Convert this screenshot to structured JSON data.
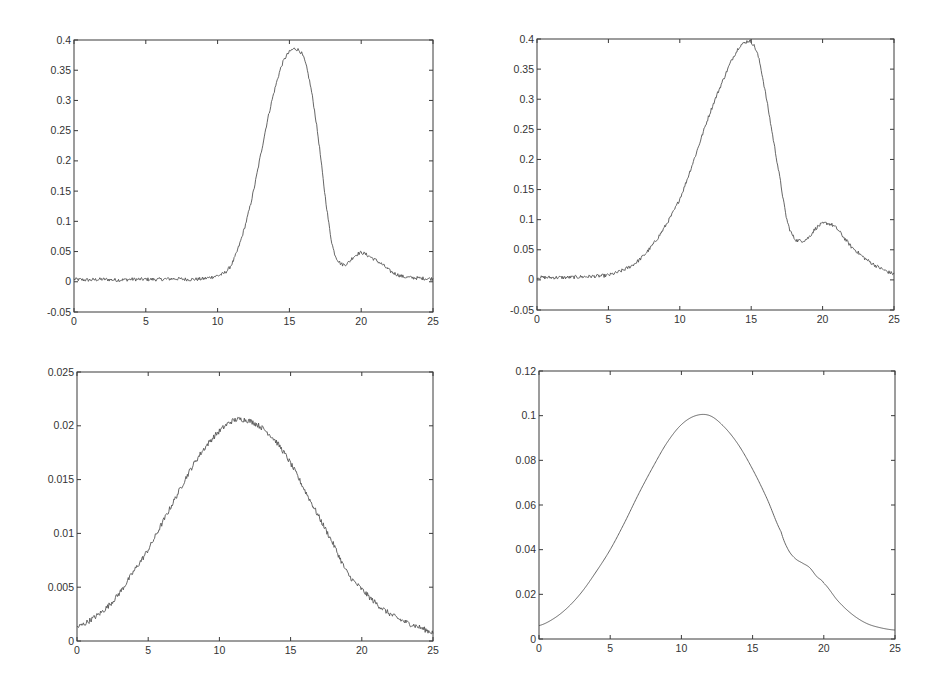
{
  "figure": {
    "background": "#ffffff",
    "line_color": "#555555",
    "axis_color": "#3a3a3a"
  },
  "chart_data": [
    {
      "id": "top-left",
      "type": "line",
      "title": "",
      "xlabel": "",
      "ylabel": "",
      "xlim": [
        0,
        25
      ],
      "ylim": [
        -0.05,
        0.4
      ],
      "xticks": [
        0,
        5,
        10,
        15,
        20,
        25
      ],
      "xtick_labels": [
        "0",
        "5",
        "10",
        "15",
        "20",
        "25"
      ],
      "yticks": [
        -0.05,
        0,
        0.05,
        0.1,
        0.15,
        0.2,
        0.25,
        0.3,
        0.35,
        0.4
      ],
      "ytick_labels": [
        "-0.05",
        "0",
        "0.05",
        "0.1",
        "0.15",
        "0.2",
        "0.25",
        "0.3",
        "0.35",
        "0.4"
      ],
      "grid": false,
      "legend": null,
      "noise": 0.003,
      "box": {
        "left": 74,
        "top": 40,
        "right": 433,
        "bottom": 312
      },
      "x": [
        0,
        1,
        2,
        3,
        4,
        5,
        6,
        7,
        8,
        9,
        10,
        10.5,
        11,
        11.5,
        12,
        12.5,
        13,
        13.5,
        14,
        14.5,
        15,
        15.5,
        16,
        16.5,
        17,
        17.5,
        18,
        18.5,
        19,
        19.5,
        20,
        20.5,
        21,
        21.5,
        22,
        22.5,
        23,
        24,
        25
      ],
      "y": [
        0.004,
        0.003,
        0.004,
        0.003,
        0.004,
        0.004,
        0.004,
        0.005,
        0.004,
        0.005,
        0.01,
        0.015,
        0.03,
        0.06,
        0.1,
        0.15,
        0.21,
        0.27,
        0.32,
        0.36,
        0.38,
        0.385,
        0.37,
        0.32,
        0.24,
        0.14,
        0.06,
        0.032,
        0.03,
        0.042,
        0.048,
        0.043,
        0.036,
        0.028,
        0.018,
        0.012,
        0.008,
        0.006,
        0.005
      ]
    },
    {
      "id": "top-right",
      "type": "line",
      "title": "",
      "xlabel": "",
      "ylabel": "",
      "xlim": [
        0,
        25
      ],
      "ylim": [
        -0.05,
        0.4
      ],
      "xticks": [
        0,
        5,
        10,
        15,
        20,
        25
      ],
      "xtick_labels": [
        "0",
        "5",
        "10",
        "15",
        "20",
        "25"
      ],
      "yticks": [
        -0.05,
        0,
        0.05,
        0.1,
        0.15,
        0.2,
        0.25,
        0.3,
        0.35,
        0.4
      ],
      "ytick_labels": [
        "-0.05",
        "0",
        "0.05",
        "0.1",
        "0.15",
        "0.2",
        "0.25",
        "0.3",
        "0.35",
        "0.4"
      ],
      "grid": false,
      "legend": null,
      "noise": 0.003,
      "box": {
        "left": 537,
        "top": 39,
        "right": 894,
        "bottom": 310
      },
      "x": [
        0,
        1,
        2,
        3,
        4,
        5,
        6,
        7,
        8,
        9,
        10,
        11,
        12,
        13,
        14,
        14.5,
        15,
        15.5,
        16,
        16.5,
        17,
        17.5,
        18,
        18.5,
        19,
        19.5,
        20,
        20.5,
        21,
        21.5,
        22,
        23,
        24,
        25
      ],
      "y": [
        0.004,
        0.004,
        0.004,
        0.005,
        0.006,
        0.008,
        0.016,
        0.03,
        0.055,
        0.09,
        0.135,
        0.2,
        0.27,
        0.33,
        0.38,
        0.393,
        0.395,
        0.37,
        0.31,
        0.24,
        0.17,
        0.1,
        0.07,
        0.065,
        0.07,
        0.085,
        0.093,
        0.093,
        0.085,
        0.07,
        0.055,
        0.035,
        0.02,
        0.01
      ]
    },
    {
      "id": "bottom-left",
      "type": "line",
      "title": "",
      "xlabel": "",
      "ylabel": "",
      "xlim": [
        0,
        25
      ],
      "ylim": [
        0,
        0.025
      ],
      "xticks": [
        0,
        5,
        10,
        15,
        20,
        25
      ],
      "xtick_labels": [
        "0",
        "5",
        "10",
        "15",
        "20",
        "25"
      ],
      "yticks": [
        0,
        0.005,
        0.01,
        0.015,
        0.02,
        0.025
      ],
      "ytick_labels": [
        "0",
        "0.005",
        "0.01",
        "0.015",
        "0.02",
        "0.025"
      ],
      "grid": false,
      "legend": null,
      "noise": 0.00025,
      "box": {
        "left": 77,
        "top": 372,
        "right": 433,
        "bottom": 641
      },
      "x": [
        0,
        1,
        2,
        3,
        4,
        5,
        6,
        7,
        8,
        9,
        10,
        11,
        12,
        13,
        14,
        15,
        16,
        17,
        18,
        19,
        20,
        21,
        22,
        23,
        24,
        25
      ],
      "y": [
        0.0013,
        0.002,
        0.003,
        0.0045,
        0.0065,
        0.0085,
        0.011,
        0.0135,
        0.016,
        0.018,
        0.0195,
        0.0205,
        0.0205,
        0.0198,
        0.0185,
        0.0165,
        0.014,
        0.0115,
        0.009,
        0.0063,
        0.0048,
        0.0035,
        0.0025,
        0.0018,
        0.0013,
        0.0008
      ]
    },
    {
      "id": "bottom-right",
      "type": "line",
      "title": "",
      "xlabel": "",
      "ylabel": "",
      "xlim": [
        0,
        25
      ],
      "ylim": [
        0,
        0.12
      ],
      "xticks": [
        0,
        5,
        10,
        15,
        20,
        25
      ],
      "xtick_labels": [
        "0",
        "5",
        "10",
        "15",
        "20",
        "25"
      ],
      "yticks": [
        0,
        0.02,
        0.04,
        0.06,
        0.08,
        0.1,
        0.12
      ],
      "ytick_labels": [
        "0",
        "0.02",
        "0.04",
        "0.06",
        "0.08",
        "0.1",
        "0.12"
      ],
      "grid": false,
      "legend": null,
      "noise": 0,
      "box": {
        "left": 539,
        "top": 371,
        "right": 895,
        "bottom": 639
      },
      "x": [
        0,
        1,
        2,
        3,
        4,
        5,
        6,
        7,
        8,
        9,
        10,
        11,
        12,
        13,
        14,
        15,
        16,
        17,
        17.5,
        18,
        18.5,
        19,
        19.5,
        20,
        21,
        22,
        23,
        24,
        25
      ],
      "y": [
        0.006,
        0.009,
        0.014,
        0.021,
        0.03,
        0.04,
        0.052,
        0.065,
        0.077,
        0.088,
        0.096,
        0.1,
        0.1,
        0.095,
        0.087,
        0.076,
        0.063,
        0.048,
        0.04,
        0.036,
        0.034,
        0.032,
        0.028,
        0.025,
        0.017,
        0.011,
        0.007,
        0.005,
        0.004
      ]
    }
  ]
}
